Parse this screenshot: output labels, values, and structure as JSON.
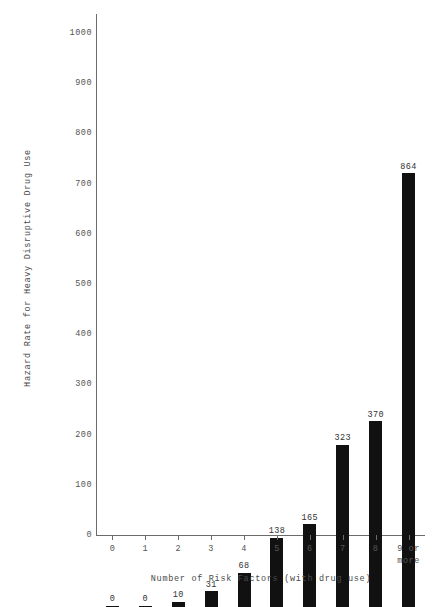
{
  "chart_data": {
    "type": "bar",
    "title": "",
    "xlabel": "Number of Risk Factors (with drug use)",
    "ylabel": "Hazard Rate for Heavy Disruptive Drug Use",
    "categories": [
      "0",
      "1",
      "2",
      "3",
      "4",
      "5",
      "6",
      "7",
      "8",
      "9 or\nmore"
    ],
    "category_labels": [
      "0",
      "1",
      "2",
      "3",
      "4",
      "5",
      "6",
      "7",
      "8",
      "9 or more"
    ],
    "values": [
      0,
      0,
      10,
      31,
      68,
      138,
      165,
      323,
      370,
      864
    ],
    "value_labels": [
      "0",
      "0",
      "10",
      "31",
      "68",
      "138",
      "165",
      "323",
      "370",
      "864"
    ],
    "ylim": [
      0,
      1000
    ],
    "yticks": [
      0,
      100,
      200,
      300,
      400,
      500,
      600,
      700,
      800,
      900,
      1000
    ],
    "ytick_labels": [
      "0",
      "100",
      "200",
      "300",
      "400",
      "500",
      "600",
      "700",
      "800",
      "900",
      "1000"
    ],
    "grid": false,
    "legend": false,
    "bar_color": "#111111",
    "axis_color": "#6b6b6b",
    "background_color": "#ffffff",
    "text_color": "#555555"
  }
}
